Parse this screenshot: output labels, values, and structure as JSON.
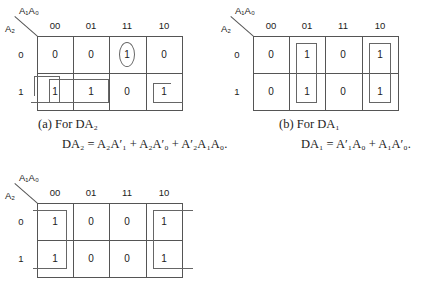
{
  "top_text": "...g... ...y ... ... ... ... ... ...g... ...p...",
  "axis_labels": {
    "col_var": "A₁A₀",
    "row_var": "A₂"
  },
  "column_headers": [
    "00",
    "01",
    "11",
    "10"
  ],
  "row_headers": [
    "0",
    "1"
  ],
  "maps": [
    {
      "id": "a",
      "cells": [
        [
          "0",
          "0",
          "1",
          "0"
        ],
        [
          "1",
          "1",
          "0",
          "1"
        ]
      ],
      "caption_label": "(a)  For DA₂",
      "equation": "DA₂ = A₂A′₁ + A₂A′₀ + A′₂A₁A₀."
    },
    {
      "id": "b",
      "cells": [
        [
          "0",
          "1",
          "0",
          "1"
        ],
        [
          "0",
          "1",
          "0",
          "1"
        ]
      ],
      "caption_label": "(b)  For DA₁",
      "equation": "DA₁ = A′₁A₀ + A₁A′₀."
    },
    {
      "id": "c",
      "cells": [
        [
          "1",
          "0",
          "0",
          "1"
        ],
        [
          "1",
          "0",
          "0",
          "1"
        ]
      ]
    }
  ]
}
